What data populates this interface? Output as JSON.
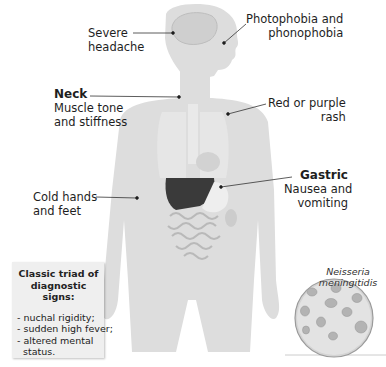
{
  "labels": {
    "severe_headache": "Severe\nheadache",
    "photophobia": "Photophobia and\nphonophobia",
    "neck_title": "Neck",
    "neck_text": "Muscle tone\nand stiffness",
    "rash": "Red or purple\nrash",
    "gastric_title": "Gastric",
    "gastric_text": "Nausea and\nvomiting",
    "cold_hands": "Cold hands\nand feet"
  },
  "triad_box": {
    "title": "Classic triad of diagnostic signs:",
    "items": [
      "- nuchal rigidity;",
      "- sudden high fever;",
      "- altered mental\n  status."
    ]
  },
  "bacteria": {
    "label": "Neisseria meningitidis"
  },
  "colors": {
    "body": "#dcdcdc",
    "organs_dark": "#3a3a3a",
    "box_bg": "#efefef",
    "leader": "#333333"
  }
}
